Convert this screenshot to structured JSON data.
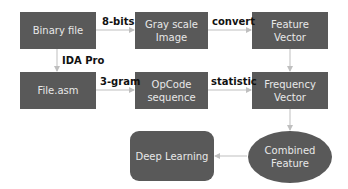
{
  "nodes": {
    "binary_file": "Binary file",
    "gray_scale_image": [
      "Gray scale",
      "Image"
    ],
    "feature_vector": [
      "Feature",
      "Vector"
    ],
    "file_asm": "File.asm",
    "opcode_sequence": [
      "OpCode",
      "sequence"
    ],
    "frequency_vector": [
      "Frequency",
      "Vector"
    ],
    "deep_learning": "Deep Learning",
    "combined_feature": [
      "Combined",
      "Feature"
    ]
  },
  "edges": {
    "binary_to_gray": "8-bits",
    "gray_to_feature": "convert",
    "binary_to_asm": "IDA Pro",
    "asm_to_opcode": "3-gram",
    "opcode_to_frequency": "statistic"
  },
  "colors": {
    "node_fill": "#595959",
    "node_text": "#e8e8e8",
    "edge": "#bfbfbf"
  }
}
